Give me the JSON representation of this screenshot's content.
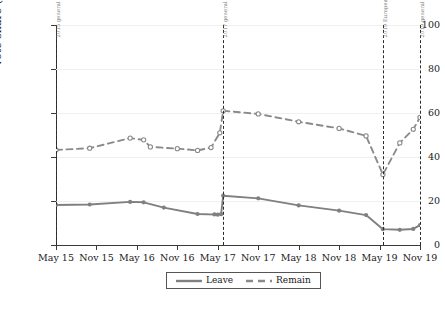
{
  "chart_data": {
    "type": "line",
    "title": "",
    "xlabel": "",
    "ylabel": "Vote share (%)",
    "ylim": [
      0,
      100
    ],
    "yticks": [
      0,
      20,
      40,
      60,
      80,
      100
    ],
    "grid": true,
    "legend_position": "bottom-center",
    "x_tick_labels": [
      "May 15",
      "Nov 15",
      "May 16",
      "Nov 16",
      "May 17",
      "Nov 17",
      "May 18",
      "Nov 18",
      "May 19",
      "Nov 19"
    ],
    "x_range_months": [
      0,
      54
    ],
    "series": [
      {
        "name": "Leave",
        "style": "solid",
        "color": "#808080",
        "marker": "circle-filled",
        "points": [
          {
            "x": 0,
            "y": 18.2
          },
          {
            "x": 5,
            "y": 18.4
          },
          {
            "x": 11,
            "y": 19.6
          },
          {
            "x": 13,
            "y": 19.4
          },
          {
            "x": 16,
            "y": 17.0
          },
          {
            "x": 21,
            "y": 14.1
          },
          {
            "x": 24,
            "y": 13.8
          },
          {
            "x": 23.5,
            "y": 13.9
          },
          {
            "x": 24.5,
            "y": 14.0
          },
          {
            "x": 24.8,
            "y": 22.4
          },
          {
            "x": 30,
            "y": 21.2
          },
          {
            "x": 36,
            "y": 18.0
          },
          {
            "x": 42,
            "y": 15.6
          },
          {
            "x": 46,
            "y": 13.6
          },
          {
            "x": 48.5,
            "y": 7.2
          },
          {
            "x": 51,
            "y": 6.9
          },
          {
            "x": 53,
            "y": 7.3
          },
          {
            "x": 54,
            "y": 9.0
          }
        ]
      },
      {
        "name": "Remain",
        "style": "dashed",
        "color": "#8a8a8a",
        "marker": "circle-open",
        "points": [
          {
            "x": 0,
            "y": 43.2
          },
          {
            "x": 5,
            "y": 44.0
          },
          {
            "x": 11,
            "y": 48.6
          },
          {
            "x": 13,
            "y": 47.8
          },
          {
            "x": 14,
            "y": 44.6
          },
          {
            "x": 18,
            "y": 43.8
          },
          {
            "x": 21,
            "y": 43.0
          },
          {
            "x": 23,
            "y": 44.3
          },
          {
            "x": 24.3,
            "y": 51.0
          },
          {
            "x": 24.8,
            "y": 61.0
          },
          {
            "x": 30,
            "y": 59.6
          },
          {
            "x": 36,
            "y": 56.0
          },
          {
            "x": 42,
            "y": 53.0
          },
          {
            "x": 46,
            "y": 49.6
          },
          {
            "x": 48.5,
            "y": 32.0
          },
          {
            "x": 51,
            "y": 46.4
          },
          {
            "x": 53,
            "y": 52.6
          },
          {
            "x": 54,
            "y": 58.0
          }
        ]
      }
    ],
    "event_lines": [
      {
        "x": 0,
        "label": "2015 general election"
      },
      {
        "x": 24.8,
        "label": "2017 general election"
      },
      {
        "x": 48.5,
        "label": "2019 European Parliament election"
      },
      {
        "x": 54,
        "label": "2019 general election"
      }
    ]
  },
  "legend": {
    "entries": [
      {
        "label": "Leave"
      },
      {
        "label": "Remain"
      }
    ]
  },
  "caption": {
    "text": ""
  }
}
